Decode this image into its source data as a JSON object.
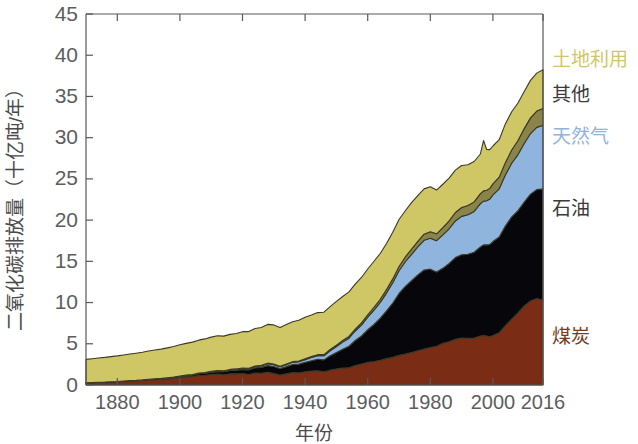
{
  "axes": {
    "y_title": "二氧化碳排放量（十亿吨/年）",
    "x_title": "年份",
    "y_ticks": [
      "0",
      "5",
      "10",
      "15",
      "20",
      "25",
      "30",
      "35",
      "40",
      "45"
    ],
    "x_ticks": [
      "1880",
      "1900",
      "1920",
      "1940",
      "1960",
      "1980",
      "2000",
      "2016"
    ]
  },
  "legend": {
    "items": [
      {
        "label": "土地利用",
        "color": "#cfc766"
      },
      {
        "label": "其他",
        "color": "#3a3a3a"
      },
      {
        "label": "天然气",
        "color": "#8fb4dd"
      },
      {
        "label": "石油",
        "color": "#3a3a3a"
      },
      {
        "label": "煤炭",
        "color": "#7a3a1c"
      }
    ]
  },
  "colors": {
    "coal": "#7a2d14",
    "oil": "#07060a",
    "gas": "#8fb4dd",
    "other": "#8a8449",
    "land_use": "#cfc766",
    "outline": "#3a3a28",
    "axis": "#58585a"
  },
  "chart_data": {
    "type": "area",
    "stacked": true,
    "title": "",
    "xlabel": "年份",
    "ylabel": "二氧化碳排放量（十亿吨/年）",
    "xlim": [
      1870,
      2016
    ],
    "ylim": [
      0,
      45
    ],
    "grid": false,
    "legend_position": "right",
    "units": "十亿吨/年",
    "x": [
      1870,
      1872,
      1874,
      1876,
      1878,
      1880,
      1882,
      1884,
      1886,
      1888,
      1890,
      1892,
      1894,
      1896,
      1898,
      1900,
      1902,
      1904,
      1906,
      1908,
      1910,
      1912,
      1914,
      1916,
      1918,
      1920,
      1922,
      1924,
      1926,
      1928,
      1930,
      1932,
      1934,
      1936,
      1938,
      1940,
      1942,
      1944,
      1946,
      1948,
      1950,
      1952,
      1954,
      1956,
      1958,
      1960,
      1962,
      1964,
      1966,
      1968,
      1970,
      1972,
      1974,
      1976,
      1978,
      1980,
      1982,
      1984,
      1986,
      1988,
      1990,
      1992,
      1994,
      1996,
      1997,
      1998,
      1999,
      2000,
      2002,
      2004,
      2006,
      2008,
      2010,
      2012,
      2014,
      2016
    ],
    "series": [
      {
        "name": "煤炭",
        "color": "#7a2d14",
        "values": [
          0.25,
          0.28,
          0.31,
          0.33,
          0.36,
          0.4,
          0.44,
          0.47,
          0.5,
          0.55,
          0.6,
          0.64,
          0.68,
          0.74,
          0.8,
          0.9,
          0.98,
          1.03,
          1.15,
          1.18,
          1.28,
          1.33,
          1.25,
          1.35,
          1.35,
          1.4,
          1.28,
          1.45,
          1.42,
          1.55,
          1.4,
          1.2,
          1.35,
          1.5,
          1.48,
          1.6,
          1.7,
          1.72,
          1.6,
          1.8,
          1.95,
          2.05,
          2.1,
          2.35,
          2.55,
          2.75,
          2.85,
          3.0,
          3.2,
          3.35,
          3.6,
          3.75,
          3.95,
          4.15,
          4.35,
          4.55,
          4.7,
          5.05,
          5.25,
          5.55,
          5.7,
          5.65,
          5.7,
          5.95,
          6.0,
          5.95,
          5.85,
          6.0,
          6.35,
          7.2,
          8.0,
          8.75,
          9.6,
          10.2,
          10.5,
          10.3
        ]
      },
      {
        "name": "石油",
        "color": "#07060a",
        "values": [
          0.01,
          0.01,
          0.02,
          0.02,
          0.03,
          0.03,
          0.04,
          0.05,
          0.05,
          0.06,
          0.07,
          0.08,
          0.09,
          0.1,
          0.12,
          0.14,
          0.16,
          0.18,
          0.21,
          0.24,
          0.28,
          0.32,
          0.35,
          0.4,
          0.45,
          0.5,
          0.56,
          0.64,
          0.72,
          0.82,
          0.85,
          0.8,
          0.88,
          0.98,
          1.05,
          1.15,
          1.25,
          1.4,
          1.45,
          1.75,
          2.0,
          2.3,
          2.6,
          3.05,
          3.4,
          3.95,
          4.5,
          5.1,
          5.8,
          6.6,
          7.5,
          8.2,
          8.7,
          9.2,
          9.6,
          9.5,
          9.0,
          9.1,
          9.5,
          9.9,
          10.1,
          10.2,
          10.4,
          10.8,
          11.0,
          11.05,
          11.2,
          11.4,
          11.6,
          12.1,
          12.4,
          12.4,
          12.6,
          12.95,
          13.2,
          13.5
        ]
      },
      {
        "name": "天然气",
        "color": "#8fb4dd",
        "values": [
          0.0,
          0.0,
          0.0,
          0.0,
          0.0,
          0.0,
          0.01,
          0.01,
          0.01,
          0.01,
          0.02,
          0.02,
          0.02,
          0.03,
          0.03,
          0.04,
          0.04,
          0.05,
          0.06,
          0.06,
          0.07,
          0.08,
          0.09,
          0.1,
          0.11,
          0.12,
          0.14,
          0.16,
          0.18,
          0.21,
          0.22,
          0.21,
          0.24,
          0.27,
          0.29,
          0.33,
          0.38,
          0.44,
          0.5,
          0.6,
          0.72,
          0.85,
          0.98,
          1.15,
          1.32,
          1.52,
          1.72,
          1.92,
          2.15,
          2.45,
          2.75,
          3.0,
          3.2,
          3.4,
          3.6,
          3.75,
          3.8,
          4.05,
          4.2,
          4.45,
          4.65,
          4.8,
          4.95,
          5.25,
          5.3,
          5.35,
          5.5,
          5.65,
          5.85,
          6.2,
          6.5,
          6.8,
          7.1,
          7.35,
          7.55,
          7.7
        ]
      },
      {
        "name": "其他",
        "color": "#8a8449",
        "values": [
          0.0,
          0.0,
          0.0,
          0.0,
          0.0,
          0.0,
          0.0,
          0.0,
          0.0,
          0.0,
          0.01,
          0.01,
          0.01,
          0.01,
          0.01,
          0.02,
          0.02,
          0.02,
          0.02,
          0.03,
          0.03,
          0.03,
          0.04,
          0.04,
          0.04,
          0.05,
          0.05,
          0.06,
          0.06,
          0.07,
          0.07,
          0.07,
          0.08,
          0.08,
          0.09,
          0.1,
          0.11,
          0.12,
          0.13,
          0.15,
          0.17,
          0.19,
          0.21,
          0.24,
          0.27,
          0.3,
          0.34,
          0.38,
          0.42,
          0.47,
          0.52,
          0.58,
          0.63,
          0.68,
          0.74,
          0.8,
          0.84,
          0.9,
          0.95,
          1.02,
          1.08,
          1.12,
          1.16,
          1.22,
          1.25,
          1.27,
          1.3,
          1.34,
          1.4,
          1.5,
          1.6,
          1.7,
          1.8,
          1.9,
          1.98,
          2.05
        ]
      },
      {
        "name": "土地利用",
        "color": "#cfc766",
        "values": [
          2.85,
          2.9,
          2.95,
          3.0,
          3.05,
          3.1,
          3.15,
          3.22,
          3.3,
          3.35,
          3.42,
          3.5,
          3.55,
          3.62,
          3.7,
          3.78,
          3.85,
          3.92,
          4.0,
          4.08,
          4.15,
          4.22,
          4.2,
          4.25,
          4.3,
          4.4,
          4.45,
          4.55,
          4.6,
          4.7,
          4.75,
          4.7,
          4.8,
          4.85,
          4.95,
          5.05,
          5.05,
          5.1,
          5.15,
          5.2,
          5.3,
          5.35,
          5.4,
          5.45,
          5.5,
          5.55,
          5.6,
          5.55,
          5.6,
          5.65,
          5.7,
          5.6,
          5.65,
          5.55,
          5.5,
          5.45,
          5.3,
          5.25,
          5.2,
          5.15,
          5.1,
          4.95,
          4.9,
          4.8,
          6.1,
          4.95,
          4.7,
          4.6,
          4.55,
          4.7,
          4.65,
          4.55,
          4.5,
          4.55,
          4.6,
          4.7
        ]
      }
    ]
  }
}
